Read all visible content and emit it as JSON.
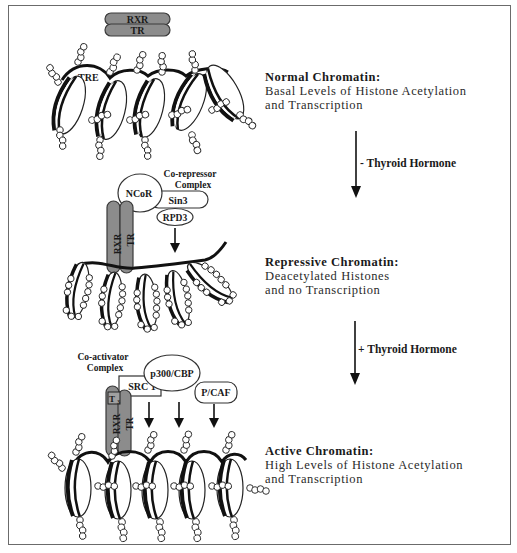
{
  "figure": {
    "topic": "Thyroid hormone receptor regulation of chromatin via histone acetylation"
  },
  "panels": [
    {
      "id": "normal",
      "title": "Normal Chromatin:",
      "lines": [
        "Basal Levels of Histone Acetylation",
        "and Transcription"
      ],
      "proteins": {
        "rxr": "RXR",
        "tr": "TR",
        "element": "TRE"
      }
    },
    {
      "id": "repressive",
      "title": "Repressive Chromatin:",
      "lines": [
        "Deacetylated Histones",
        "and no Transcription"
      ],
      "complex_label": [
        "Co-repressor",
        "Complex"
      ],
      "proteins": {
        "ncor": "NCoR",
        "sin3": "Sin3",
        "rpd3": "RPD3",
        "rxr": "RXR",
        "tr": "TR"
      }
    },
    {
      "id": "active",
      "title": "Active Chromatin:",
      "lines": [
        "High Levels of Histone Acetylation",
        "and Transcription"
      ],
      "complex_label": [
        "Co-activator",
        "Complex"
      ],
      "proteins": {
        "p300": "p300/CBP",
        "src1": "SRC 1",
        "pcaf": "P/CAF",
        "t3": "T",
        "t3_sub": "3",
        "rxr": "RXR",
        "tr": "TR"
      }
    }
  ],
  "transitions": [
    {
      "label": "- Thyroid Hormone"
    },
    {
      "label": "+ Thyroid Hormone"
    }
  ],
  "colors": {
    "receptor_fill": "#8c8c8c",
    "receptor_stroke": "#3a3a3a",
    "dna": "#111111",
    "frame": "#6b6b6b"
  }
}
